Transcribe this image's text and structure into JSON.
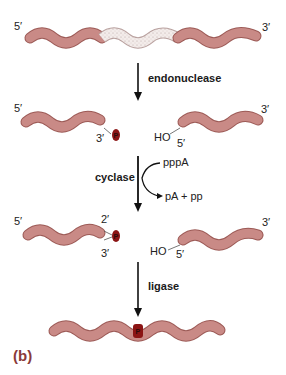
{
  "figure": {
    "label": "(b)",
    "colors": {
      "strand_fill": "#c98a86",
      "strand_stroke": "#9c5a56",
      "stipple_fill": "#f3ecea",
      "phosphate_fill": "#8b1414",
      "phosphate_text": "#2a0a0a",
      "figure_label": "#8a3a3a",
      "arrow": "#111111"
    }
  },
  "step1": {
    "prime_left": "5′",
    "prime_right": "3′",
    "segment": "stippled damaged region"
  },
  "arrow1": {
    "label": "endonuclease"
  },
  "step2": {
    "left_5": "5′",
    "left_3": "3′",
    "phosphate": "P",
    "ho": "HO",
    "right_5": "5′",
    "right_3": "3′"
  },
  "arrow2": {
    "label": "cyclase",
    "input": "pppA",
    "output": "pA + pp"
  },
  "step3": {
    "left_5": "5′",
    "two_prime": "2′",
    "three_prime": "3′",
    "phosphate": "P",
    "ho": "HO",
    "right_5": "5′",
    "right_3": "3′"
  },
  "arrow3": {
    "label": "ligase"
  },
  "step4": {
    "phosphate": "P"
  }
}
